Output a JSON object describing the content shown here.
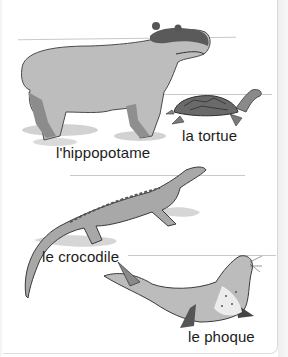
{
  "illustration": {
    "description": "Children's French vocabulary illustration of four animals",
    "animals": [
      {
        "id": "hippo",
        "label": "l'hippopotame"
      },
      {
        "id": "turtle",
        "label": "la tortue"
      },
      {
        "id": "crocodile",
        "label": "le crocodile"
      },
      {
        "id": "seal",
        "label": "le phoque"
      }
    ]
  },
  "colors": {
    "text": "#1c1c1c",
    "ink": "#3a3a3a",
    "body_gray": "#b9b9b9",
    "shadow_gray": "#cfcfcf"
  }
}
